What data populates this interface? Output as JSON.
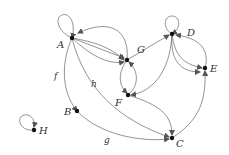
{
  "diagram": {
    "type": "directed-graph",
    "nodes": [
      {
        "id": "A",
        "label": "A"
      },
      {
        "id": "B",
        "label": "B"
      },
      {
        "id": "C",
        "label": "C"
      },
      {
        "id": "D",
        "label": "D"
      },
      {
        "id": "E",
        "label": "E"
      },
      {
        "id": "F",
        "label": "F"
      },
      {
        "id": "G",
        "label": "G"
      },
      {
        "id": "H",
        "label": "H"
      }
    ],
    "edge_labels": {
      "f": "f",
      "g": "g",
      "h": "h"
    },
    "edges": [
      {
        "from": "A",
        "to": "A",
        "loop": true
      },
      {
        "from": "G",
        "to": "A"
      },
      {
        "from": "A",
        "to": "G"
      },
      {
        "from": "A",
        "to": "G",
        "curved": true
      },
      {
        "from": "A",
        "to": "F"
      },
      {
        "from": "A",
        "to": "B",
        "label": "f"
      },
      {
        "from": "A",
        "to": "C",
        "label": "h"
      },
      {
        "from": "B",
        "to": "C",
        "label": "g"
      },
      {
        "from": "G",
        "to": "F"
      },
      {
        "from": "F",
        "to": "G"
      },
      {
        "from": "G",
        "to": "D"
      },
      {
        "from": "D",
        "to": "D",
        "loop": true
      },
      {
        "from": "D",
        "to": "E"
      },
      {
        "from": "D",
        "to": "E",
        "curved": true
      },
      {
        "from": "E",
        "to": "D"
      },
      {
        "from": "D",
        "to": "F"
      },
      {
        "from": "F",
        "to": "C"
      },
      {
        "from": "C",
        "to": "E"
      },
      {
        "from": "H",
        "to": "H",
        "loop": true
      }
    ]
  }
}
